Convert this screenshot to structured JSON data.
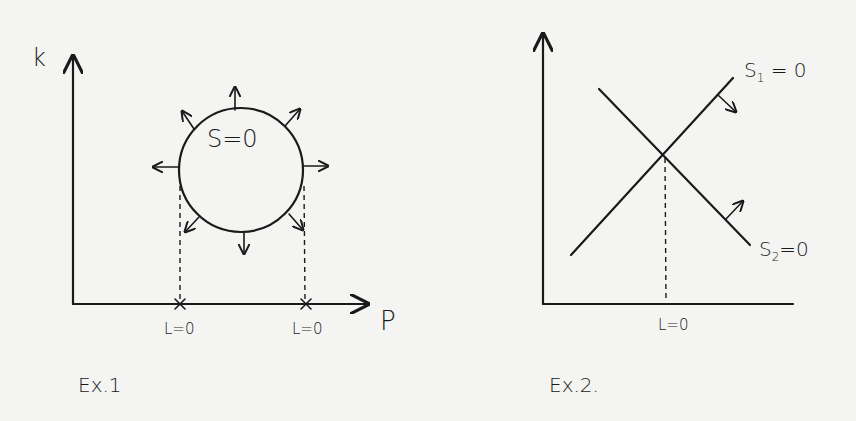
{
  "figures": [
    {
      "id": "ex1",
      "caption": "Ex.1",
      "axes": {
        "x_label": "P",
        "y_label": "k"
      },
      "curve_label": "S=0",
      "curve_shape": "circle",
      "normal_arrows": "outward, 8 directions",
      "intersections": [
        {
          "label": "L=0",
          "marker": "x"
        },
        {
          "label": "L=0",
          "marker": "x"
        }
      ]
    },
    {
      "id": "ex2",
      "caption": "Ex.2.",
      "axes": {
        "x_label": "",
        "y_label": ""
      },
      "lines": [
        {
          "label_main": "S",
          "label_sub": "1",
          "label_rest": " = 0",
          "slope": "positive",
          "normal_arrow": "down-right"
        },
        {
          "label_main": "S",
          "label_sub": "2",
          "label_rest": "=0",
          "slope": "negative",
          "normal_arrow": "up-right"
        }
      ],
      "intersection_label": "L=0"
    }
  ],
  "colors": {
    "ink": "#1a1a1a",
    "paper": "#f4f4f2"
  }
}
